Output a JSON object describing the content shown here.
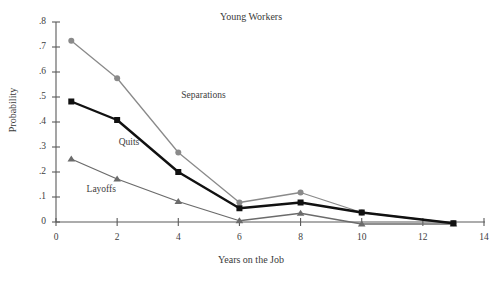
{
  "chart_data": {
    "type": "line",
    "title": "Young Workers",
    "xlabel": "Years on the Job",
    "ylabel": "Probability",
    "xlim": [
      0,
      14
    ],
    "ylim": [
      0,
      0.8
    ],
    "grid": false,
    "legend_position": "inline-annotations",
    "x_ticks": [
      "0",
      "2",
      "4",
      "6",
      "8",
      "10",
      "12",
      "14"
    ],
    "x_tick_values": [
      0,
      2,
      4,
      6,
      8,
      10,
      12,
      14
    ],
    "y_ticks": [
      "0",
      ".1",
      ".2",
      ".3",
      ".4",
      ".5",
      ".6",
      ".7",
      ".8"
    ],
    "y_tick_values": [
      0,
      0.1,
      0.2,
      0.3,
      0.4,
      0.5,
      0.6,
      0.7,
      0.8
    ],
    "x": [
      0.5,
      2,
      4,
      6,
      8,
      10,
      13
    ],
    "series": [
      {
        "name": "Separations",
        "marker": "circle",
        "color": "#8a8a8a",
        "values": [
          0.725,
          0.575,
          0.278,
          0.078,
          0.118,
          0.038,
          -0.005
        ],
        "label_x": 4.1,
        "label_y": 0.505
      },
      {
        "name": "Quits",
        "marker": "square",
        "color": "#111111",
        "values": [
          0.482,
          0.408,
          0.2,
          0.055,
          0.078,
          0.038,
          -0.005
        ],
        "label_x": 2.05,
        "label_y": 0.318
      },
      {
        "name": "Layoffs",
        "marker": "triangle",
        "color": "#6b6b6b",
        "values": [
          0.252,
          0.172,
          0.082,
          0.005,
          0.035,
          -0.008,
          -0.008
        ],
        "label_x": 1.0,
        "label_y": 0.128
      }
    ]
  }
}
